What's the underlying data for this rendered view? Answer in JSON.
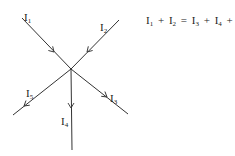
{
  "diagram": {
    "junction": {
      "x": 71,
      "y": 69
    },
    "currents": [
      {
        "id": "I1",
        "symbol": "I",
        "subscript": "1",
        "direction": "in",
        "label_pos": {
          "x": 24,
          "y": 12
        }
      },
      {
        "id": "I2",
        "symbol": "I",
        "subscript": "2",
        "direction": "in",
        "label_pos": {
          "x": 100,
          "y": 22
        }
      },
      {
        "id": "I3",
        "symbol": "I",
        "subscript": "3",
        "direction": "out",
        "label_pos": {
          "x": 110,
          "y": 93
        }
      },
      {
        "id": "I4",
        "symbol": "I",
        "subscript": "4",
        "direction": "out",
        "label_pos": {
          "x": 61,
          "y": 116
        }
      },
      {
        "id": "I5",
        "symbol": "I",
        "subscript": "5",
        "direction": "out",
        "label_pos": {
          "x": 26,
          "y": 88
        }
      }
    ],
    "equation": {
      "terms_left": [
        {
          "symbol": "I",
          "subscript": "1"
        },
        {
          "symbol": "I",
          "subscript": "2"
        }
      ],
      "terms_right": [
        {
          "symbol": "I",
          "subscript": "3"
        },
        {
          "symbol": "I",
          "subscript": "4"
        },
        {
          "symbol": "I",
          "subscript": "5"
        }
      ],
      "plus": "+",
      "equals": "=",
      "text": "I1 + I2 = I3 + I4 + I5"
    }
  }
}
